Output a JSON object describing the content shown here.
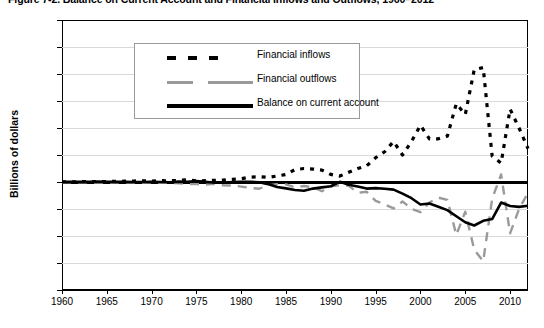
{
  "figure": {
    "title": "Figure 7-2. Balance on Current Account and Financial Inflows and Outflows, 1960–2012",
    "ylabel": "Billions of dollars"
  },
  "legend": {
    "position": "top-left inside plot",
    "items": [
      {
        "label": "Financial inflows",
        "style": "dotted",
        "color": "#000000",
        "icon": "dotted-line-swatch"
      },
      {
        "label": "Financial outflows",
        "style": "dashed",
        "color": "#9a9a9a",
        "icon": "dashed-line-swatch"
      },
      {
        "label": "Balance on current account",
        "style": "solid",
        "color": "#000000",
        "icon": "solid-line-swatch"
      }
    ]
  },
  "axes": {
    "y_ticks": [
      "3,000",
      "2,500",
      "2,000",
      "1,500",
      "1,000",
      "500",
      "0",
      "-500",
      "-1,000",
      "-1,500",
      "-2,000"
    ],
    "x_ticks": [
      "1960",
      "1965",
      "1970",
      "1975",
      "1980",
      "1985",
      "1990",
      "1995",
      "2000",
      "2005",
      "2010"
    ]
  },
  "chart_data": {
    "type": "line",
    "title": "Figure 7-2. Balance on Current Account and Financial Inflows and Outflows, 1960–2012",
    "xlabel": "",
    "ylabel": "Billions of dollars",
    "xlim": [
      1960,
      2012
    ],
    "ylim": [
      -2000,
      3000
    ],
    "ytick_step": 500,
    "xtick_step": 5,
    "grid": true,
    "zero_line": true,
    "legend_position": "upper left",
    "x": [
      1960,
      1961,
      1962,
      1963,
      1964,
      1965,
      1966,
      1967,
      1968,
      1969,
      1970,
      1971,
      1972,
      1973,
      1974,
      1975,
      1976,
      1977,
      1978,
      1979,
      1980,
      1981,
      1982,
      1983,
      1984,
      1985,
      1986,
      1987,
      1988,
      1989,
      1990,
      1991,
      1992,
      1993,
      1994,
      1995,
      1996,
      1997,
      1998,
      1999,
      2000,
      2001,
      2002,
      2003,
      2004,
      2005,
      2006,
      2007,
      2008,
      2009,
      2010,
      2011,
      2012
    ],
    "series": [
      {
        "name": "Financial inflows",
        "style": "dotted",
        "color": "#000000",
        "values": [
          3,
          4,
          5,
          8,
          10,
          8,
          12,
          15,
          18,
          22,
          18,
          25,
          22,
          30,
          40,
          20,
          25,
          30,
          35,
          50,
          60,
          90,
          100,
          85,
          110,
          140,
          230,
          250,
          240,
          220,
          140,
          110,
          180,
          250,
          300,
          450,
          560,
          750,
          500,
          750,
          1050,
          800,
          800,
          850,
          1450,
          1250,
          2080,
          2120,
          480,
          350,
          1350,
          1000,
          620
        ]
      },
      {
        "name": "Financial outflows",
        "style": "dashed",
        "color": "#9a9a9a",
        "values": [
          -4,
          -5,
          -6,
          -8,
          -10,
          -12,
          -10,
          -12,
          -12,
          -15,
          -12,
          -15,
          -14,
          -25,
          -35,
          -40,
          -50,
          -35,
          -60,
          -65,
          -85,
          -110,
          -125,
          -60,
          -40,
          -45,
          -100,
          -75,
          -95,
          -170,
          -80,
          -60,
          -70,
          -200,
          -180,
          -350,
          -415,
          -490,
          -360,
          -500,
          -560,
          -380,
          -290,
          -330,
          -980,
          -550,
          -1250,
          -1470,
          -310,
          140,
          -950,
          -500,
          -200
        ]
      },
      {
        "name": "Balance on current account",
        "style": "solid",
        "color": "#000000",
        "values": [
          3,
          4,
          4,
          4,
          7,
          6,
          3,
          3,
          1,
          0,
          2,
          -1,
          -6,
          7,
          2,
          18,
          4,
          -14,
          -15,
          -1,
          2,
          5,
          -6,
          -39,
          -94,
          -118,
          -147,
          -161,
          -122,
          -100,
          -79,
          3,
          -50,
          -85,
          -122,
          -114,
          -125,
          -141,
          -215,
          -300,
          -417,
          -397,
          -459,
          -521,
          -634,
          -745,
          -806,
          -719,
          -687,
          -381,
          -444,
          -460,
          -440
        ]
      }
    ]
  }
}
